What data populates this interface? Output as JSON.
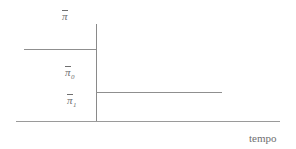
{
  "figure": {
    "width": 296,
    "height": 149,
    "background_color": "#ffffff",
    "line_color": "#8a8a8a",
    "text_color": "#6f6f6f"
  },
  "labels": {
    "pi_bar": {
      "symbol": "π",
      "subscript": "",
      "full_text": "π̄"
    },
    "pi_bar_zero": {
      "symbol": "π",
      "subscript": "0",
      "full_text": "π̄0"
    },
    "pi_bar_one": {
      "symbol": "π",
      "subscript": "1",
      "full_text": "π̄1"
    }
  },
  "axes": {
    "x_axis_label": "tempo",
    "y_axis_label": "π̄",
    "vertical_axis": {
      "x": 96,
      "y_top": 24,
      "y_bottom": 121
    },
    "horizontal_axis": {
      "y": 121,
      "x_left": 16,
      "x_right": 280
    }
  },
  "chart_data": {
    "type": "line",
    "title": "",
    "xlabel": "tempo",
    "ylabel": "π̄",
    "grid": false,
    "legend_position": "none",
    "annotations": [
      {
        "text": "π̄",
        "role": "y-axis-title",
        "x": 62,
        "y": 7
      },
      {
        "text": "π̄0",
        "role": "level-label-before",
        "x": 65,
        "y": 63
      },
      {
        "text": "π̄1",
        "role": "level-label-after",
        "x": 67,
        "y": 91
      },
      {
        "text": "tempo",
        "role": "x-axis-title",
        "x": 249,
        "y": 133
      }
    ],
    "series": [
      {
        "name": "π̄0",
        "description": "inflation level before policy change (left of vertical axis)",
        "style": "horizontal-segment",
        "x": [
          24,
          96
        ],
        "values": [
          49,
          49
        ],
        "level": 49
      },
      {
        "name": "π̄1",
        "description": "inflation level after policy change (right of vertical axis)",
        "style": "horizontal-segment",
        "x": [
          96,
          222
        ],
        "values": [
          92,
          92
        ],
        "level": 92
      }
    ],
    "xlim": [
      16,
      280
    ],
    "ylim": [
      121,
      24
    ]
  }
}
